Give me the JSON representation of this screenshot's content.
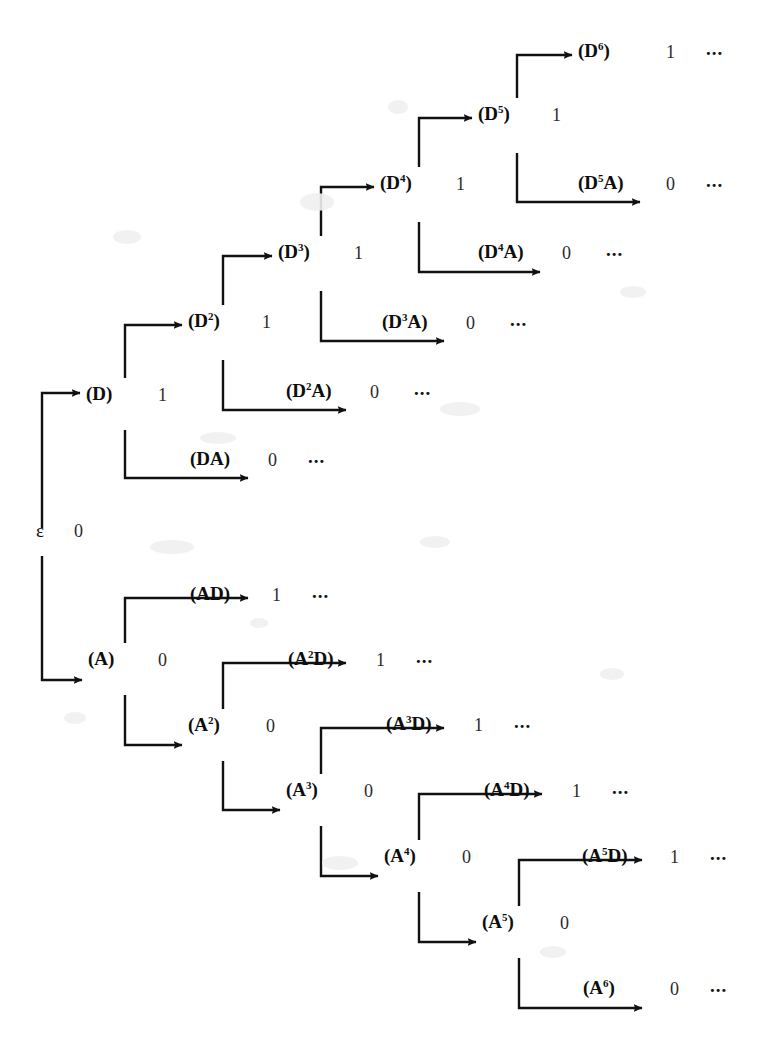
{
  "figure": {
    "background_color": "#ffffff",
    "ink_color": "#111111",
    "width": 770,
    "height": 1058,
    "ellipsis": "..."
  },
  "root": {
    "label": "ε",
    "value": "0",
    "x": 36,
    "y": 520
  },
  "nodes": [
    {
      "id": "D",
      "base": "D",
      "sup": "",
      "suffix": "",
      "value": "1",
      "ellipsis": "",
      "x": 86,
      "y": 383,
      "vx": 158,
      "ex": 0
    },
    {
      "id": "DA",
      "base": "DA",
      "sup": "",
      "suffix": "",
      "value": "0",
      "ellipsis": "...",
      "x": 190,
      "y": 448,
      "vx": 268,
      "ex": 308
    },
    {
      "id": "D2",
      "base": "D",
      "sup": "2",
      "suffix": "",
      "value": "1",
      "ellipsis": "",
      "x": 188,
      "y": 310,
      "vx": 262,
      "ex": 0
    },
    {
      "id": "D2A",
      "base": "D",
      "sup": "2",
      "suffix": "A",
      "value": "0",
      "ellipsis": "...",
      "x": 286,
      "y": 380,
      "vx": 370,
      "ex": 414
    },
    {
      "id": "D3",
      "base": "D",
      "sup": "3",
      "suffix": "",
      "value": "1",
      "ellipsis": "",
      "x": 278,
      "y": 241,
      "vx": 354,
      "ex": 0
    },
    {
      "id": "D3A",
      "base": "D",
      "sup": "3",
      "suffix": "A",
      "value": "0",
      "ellipsis": "...",
      "x": 382,
      "y": 311,
      "vx": 466,
      "ex": 510
    },
    {
      "id": "D4",
      "base": "D",
      "sup": "4",
      "suffix": "",
      "value": "1",
      "ellipsis": "",
      "x": 380,
      "y": 172,
      "vx": 456,
      "ex": 0
    },
    {
      "id": "D4A",
      "base": "D",
      "sup": "4",
      "suffix": "A",
      "value": "0",
      "ellipsis": "...",
      "x": 478,
      "y": 241,
      "vx": 562,
      "ex": 606
    },
    {
      "id": "D5",
      "base": "D",
      "sup": "5",
      "suffix": "",
      "value": "1",
      "ellipsis": "",
      "x": 478,
      "y": 103,
      "vx": 552,
      "ex": 0
    },
    {
      "id": "D5A",
      "base": "D",
      "sup": "5",
      "suffix": "A",
      "value": "0",
      "ellipsis": "...",
      "x": 578,
      "y": 172,
      "vx": 666,
      "ex": 706
    },
    {
      "id": "D6",
      "base": "D",
      "sup": "6",
      "suffix": "",
      "value": "1",
      "ellipsis": "...",
      "x": 578,
      "y": 40,
      "vx": 666,
      "ex": 706
    },
    {
      "id": "A",
      "base": "A",
      "sup": "",
      "suffix": "",
      "value": "0",
      "ellipsis": "",
      "x": 88,
      "y": 648,
      "vx": 158,
      "ex": 0
    },
    {
      "id": "AD",
      "base": "AD",
      "sup": "",
      "suffix": "",
      "value": "1",
      "ellipsis": "...",
      "x": 190,
      "y": 583,
      "vx": 272,
      "ex": 312
    },
    {
      "id": "A2",
      "base": "A",
      "sup": "2",
      "suffix": "",
      "value": "0",
      "ellipsis": "",
      "x": 188,
      "y": 714,
      "vx": 266,
      "ex": 0
    },
    {
      "id": "A2D",
      "base": "A",
      "sup": "2",
      "suffix": "D",
      "value": "1",
      "ellipsis": "...",
      "x": 288,
      "y": 648,
      "vx": 376,
      "ex": 416
    },
    {
      "id": "A3",
      "base": "A",
      "sup": "3",
      "suffix": "",
      "value": "0",
      "ellipsis": "",
      "x": 286,
      "y": 779,
      "vx": 364,
      "ex": 0
    },
    {
      "id": "A3D",
      "base": "A",
      "sup": "3",
      "suffix": "D",
      "value": "1",
      "ellipsis": "...",
      "x": 386,
      "y": 713,
      "vx": 474,
      "ex": 514
    },
    {
      "id": "A4",
      "base": "A",
      "sup": "4",
      "suffix": "",
      "value": "0",
      "ellipsis": "",
      "x": 384,
      "y": 845,
      "vx": 462,
      "ex": 0
    },
    {
      "id": "A4D",
      "base": "A",
      "sup": "4",
      "suffix": "D",
      "value": "1",
      "ellipsis": "...",
      "x": 484,
      "y": 779,
      "vx": 572,
      "ex": 612
    },
    {
      "id": "A5",
      "base": "A",
      "sup": "5",
      "suffix": "",
      "value": "0",
      "ellipsis": "",
      "x": 482,
      "y": 911,
      "vx": 560,
      "ex": 0
    },
    {
      "id": "A5D",
      "base": "A",
      "sup": "5",
      "suffix": "D",
      "value": "1",
      "ellipsis": "...",
      "x": 582,
      "y": 845,
      "vx": 670,
      "ex": 710
    },
    {
      "id": "A6",
      "base": "A",
      "sup": "6",
      "suffix": "",
      "value": "0",
      "ellipsis": "...",
      "x": 583,
      "y": 977,
      "vx": 670,
      "ex": 710
    }
  ],
  "edges": [
    {
      "from": "root",
      "to": "D",
      "path": "M 42 528 L 42 393 L 80 393"
    },
    {
      "from": "root",
      "to": "A",
      "path": "M 42 556 L 42 680 L 82 680"
    },
    {
      "from": "D",
      "to": "D2",
      "path": "M 125 378 L 125 325 L 182 325"
    },
    {
      "from": "D",
      "to": "DA",
      "path": "M 125 430 L 125 478 L 248 478"
    },
    {
      "from": "D2",
      "to": "D3",
      "path": "M 223 305 L 223 256 L 272 256"
    },
    {
      "from": "D2",
      "to": "D2A",
      "path": "M 223 360 L 223 410 L 346 410"
    },
    {
      "from": "D3",
      "to": "D4",
      "path": "M 321 236 L 321 187 L 374 187"
    },
    {
      "from": "D3",
      "to": "D3A",
      "path": "M 321 291 L 321 341 L 444 341"
    },
    {
      "from": "D4",
      "to": "D5",
      "path": "M 419 167 L 419 118 L 472 118"
    },
    {
      "from": "D4",
      "to": "D4A",
      "path": "M 419 222 L 419 272 L 540 272"
    },
    {
      "from": "D5",
      "to": "D6",
      "path": "M 517 98 L 517 55 L 572 55"
    },
    {
      "from": "D5",
      "to": "D5A",
      "path": "M 517 153 L 517 202 L 640 202"
    },
    {
      "from": "A",
      "to": "AD",
      "path": "M 125 643 L 125 598 L 248 598"
    },
    {
      "from": "A",
      "to": "A2",
      "path": "M 125 695 L 125 745 L 182 745"
    },
    {
      "from": "A2",
      "to": "A2D",
      "path": "M 223 709 L 223 663 L 346 663"
    },
    {
      "from": "A2",
      "to": "A3",
      "path": "M 223 761 L 223 810 L 280 810"
    },
    {
      "from": "A3",
      "to": "A3D",
      "path": "M 321 774 L 321 728 L 444 728"
    },
    {
      "from": "A3",
      "to": "A4",
      "path": "M 321 826 L 321 876 L 378 876"
    },
    {
      "from": "A4",
      "to": "A4D",
      "path": "M 419 840 L 419 794 L 542 794"
    },
    {
      "from": "A4",
      "to": "A5",
      "path": "M 419 892 L 419 942 L 476 942"
    },
    {
      "from": "A5",
      "to": "A5D",
      "path": "M 519 906 L 519 860 L 642 860"
    },
    {
      "from": "A5",
      "to": "A6",
      "path": "M 519 958 L 519 1008 L 642 1008"
    }
  ],
  "specks": [
    {
      "x": 300,
      "y": 193,
      "w": 34,
      "h": 18
    },
    {
      "x": 388,
      "y": 100,
      "w": 20,
      "h": 14
    },
    {
      "x": 113,
      "y": 230,
      "w": 28,
      "h": 14
    },
    {
      "x": 200,
      "y": 432,
      "w": 36,
      "h": 12
    },
    {
      "x": 440,
      "y": 402,
      "w": 40,
      "h": 14
    },
    {
      "x": 620,
      "y": 286,
      "w": 26,
      "h": 12
    },
    {
      "x": 150,
      "y": 540,
      "w": 44,
      "h": 14
    },
    {
      "x": 420,
      "y": 536,
      "w": 30,
      "h": 12
    },
    {
      "x": 322,
      "y": 856,
      "w": 36,
      "h": 14
    },
    {
      "x": 600,
      "y": 668,
      "w": 24,
      "h": 12
    },
    {
      "x": 64,
      "y": 712,
      "w": 22,
      "h": 12
    },
    {
      "x": 250,
      "y": 618,
      "w": 18,
      "h": 10
    },
    {
      "x": 540,
      "y": 946,
      "w": 26,
      "h": 12
    }
  ]
}
